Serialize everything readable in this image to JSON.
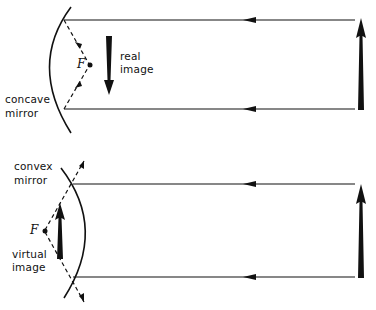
{
  "diagram": {
    "top_panel": {
      "mirror_label_line1": "concave",
      "mirror_label_line2": "mirror",
      "image_label_line1": "real",
      "image_label_line2": "image",
      "focal_label": "F"
    },
    "bottom_panel": {
      "mirror_label_line1": "convex",
      "mirror_label_line2": "mirror",
      "image_label_line1": "virtual",
      "image_label_line2": "image",
      "focal_label": "F"
    },
    "colors": {
      "ink": "#111111",
      "background": "#ffffff"
    }
  }
}
